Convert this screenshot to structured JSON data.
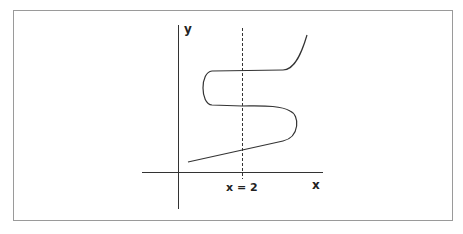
{
  "diagram": {
    "axis_labels": {
      "x": "x",
      "y": "y"
    },
    "vertical_line_label": "x = 2"
  }
}
